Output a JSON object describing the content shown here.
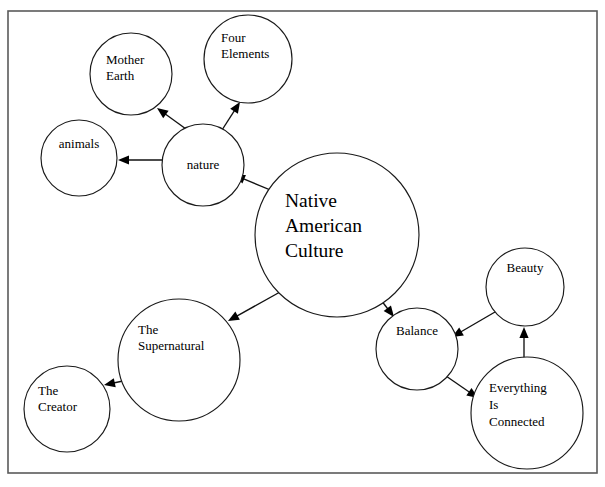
{
  "diagram": {
    "frame": {
      "x": 8,
      "y": 11,
      "width": 589,
      "height": 462,
      "stroke": "#5a5a5a"
    },
    "background_color": "#ffffff",
    "line_color": "#111111",
    "text_color": "#000000"
  },
  "nodes": [
    {
      "id": "native-american-culture",
      "label": "Native American Culture",
      "lines": [
        "Native",
        "American",
        "Culture"
      ],
      "cx": 337,
      "cy": 235,
      "r": 82,
      "font_size": 19.5,
      "text_anchor": "start",
      "text_x": 285,
      "text_y": 207,
      "line_height": 25
    },
    {
      "id": "nature",
      "label": "nature",
      "lines": [
        "nature"
      ],
      "cx": 203,
      "cy": 165,
      "r": 41,
      "font_size": 13,
      "text_anchor": "middle",
      "text_x": 203,
      "text_y": 169,
      "line_height": 15
    },
    {
      "id": "mother-earth",
      "label": "Mother Earth",
      "lines": [
        "Mother",
        "Earth"
      ],
      "cx": 131,
      "cy": 74,
      "r": 41,
      "font_size": 13,
      "text_anchor": "start",
      "text_x": 106,
      "text_y": 64,
      "line_height": 16
    },
    {
      "id": "four-elements",
      "label": "Four Elements",
      "lines": [
        "Four",
        "Elements"
      ],
      "cx": 248,
      "cy": 59,
      "r": 44,
      "font_size": 13,
      "text_anchor": "start",
      "text_x": 221,
      "text_y": 42,
      "line_height": 16
    },
    {
      "id": "animals",
      "label": "animals",
      "lines": [
        "animals"
      ],
      "cx": 79,
      "cy": 158,
      "r": 38,
      "font_size": 13,
      "text_anchor": "middle",
      "text_x": 79,
      "text_y": 148,
      "line_height": 15
    },
    {
      "id": "the-supernatural",
      "label": "The Supernatural",
      "lines": [
        "The",
        "Supernatural"
      ],
      "cx": 179,
      "cy": 360,
      "r": 61,
      "font_size": 13,
      "text_anchor": "start",
      "text_x": 138,
      "text_y": 334,
      "line_height": 16
    },
    {
      "id": "the-creator",
      "label": "The Creator",
      "lines": [
        "The",
        "Creator"
      ],
      "cx": 67,
      "cy": 409,
      "r": 43,
      "font_size": 13,
      "text_anchor": "start",
      "text_x": 38,
      "text_y": 395,
      "line_height": 16
    },
    {
      "id": "balance",
      "label": "Balance",
      "lines": [
        "Balance"
      ],
      "cx": 417,
      "cy": 349,
      "r": 41,
      "font_size": 13,
      "text_anchor": "middle",
      "text_x": 417,
      "text_y": 335,
      "line_height": 15
    },
    {
      "id": "beauty",
      "label": "Beauty",
      "lines": [
        "Beauty"
      ],
      "cx": 525,
      "cy": 287,
      "r": 39,
      "font_size": 13,
      "text_anchor": "middle",
      "text_x": 525,
      "text_y": 272,
      "line_height": 15
    },
    {
      "id": "everything-is-connected",
      "label": "Everything Is Connected",
      "lines": [
        "Everything",
        "Is",
        "Connected"
      ],
      "cx": 527,
      "cy": 413,
      "r": 56,
      "font_size": 13,
      "text_anchor": "start",
      "text_x": 489,
      "text_y": 392,
      "line_height": 17
    }
  ],
  "links": [
    {
      "id": "nac-to-nature",
      "from": "native-american-culture",
      "to": "nature",
      "x1": 280,
      "y1": 194,
      "x2": 234,
      "y2": 175,
      "arrow_at": "to"
    },
    {
      "id": "nature-to-mother-earth",
      "from": "nature",
      "to": "mother-earth",
      "x1": 186,
      "y1": 129,
      "x2": 157,
      "y2": 108,
      "arrow_at": "to"
    },
    {
      "id": "nature-to-four-elements",
      "from": "nature",
      "to": "four-elements",
      "x1": 222,
      "y1": 130,
      "x2": 240,
      "y2": 102,
      "arrow_at": "to"
    },
    {
      "id": "nature-to-animals",
      "from": "nature",
      "to": "animals",
      "x1": 162,
      "y1": 160,
      "x2": 118,
      "y2": 160,
      "arrow_at": "to"
    },
    {
      "id": "nac-to-supernatural",
      "from": "native-american-culture",
      "to": "the-supernatural",
      "x1": 280,
      "y1": 292,
      "x2": 228,
      "y2": 321,
      "arrow_at": "to"
    },
    {
      "id": "supernatural-to-creator",
      "from": "the-supernatural",
      "to": "the-creator",
      "x1": 137,
      "y1": 378,
      "x2": 104,
      "y2": 385,
      "arrow_at": "to"
    },
    {
      "id": "nac-to-balance",
      "from": "native-american-culture",
      "to": "balance",
      "x1": 371,
      "y1": 287,
      "x2": 394,
      "y2": 317,
      "arrow_at": "to"
    },
    {
      "id": "beauty-to-balance",
      "from": "beauty",
      "to": "balance",
      "x1": 495,
      "y1": 312,
      "x2": 452,
      "y2": 337,
      "arrow_at": "to"
    },
    {
      "id": "eic-to-beauty",
      "from": "everything-is-connected",
      "to": "beauty",
      "x1": 524,
      "y1": 358,
      "x2": 524,
      "y2": 327,
      "arrow_at": "to"
    },
    {
      "id": "balance-to-eic",
      "from": "balance",
      "to": "everything-is-connected",
      "x1": 446,
      "y1": 376,
      "x2": 478,
      "y2": 398,
      "arrow_at": "to"
    }
  ]
}
